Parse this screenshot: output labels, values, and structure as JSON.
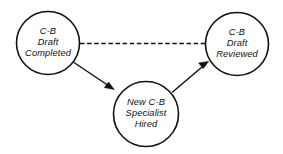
{
  "diagram": {
    "type": "node-link-diagram",
    "background_color": "#ffffff",
    "stroke_color": "#111111",
    "nodes": [
      {
        "id": "cb-draft-completed",
        "shape": "circle",
        "cx": 48,
        "cy": 43,
        "r": 31.5,
        "lines": [
          "C-B",
          "Draft",
          "Completed"
        ]
      },
      {
        "id": "new-cb-specialist-hired",
        "shape": "circle",
        "cx": 146,
        "cy": 114,
        "r": 32.5,
        "lines": [
          "New C-B",
          "Specialist",
          "Hired"
        ]
      },
      {
        "id": "cb-draft-reviewed",
        "shape": "circle",
        "cx": 237,
        "cy": 44,
        "r": 31.5,
        "lines": [
          "C-B",
          "Draft",
          "Reviewed"
        ]
      }
    ],
    "edges": [
      {
        "id": "edge-completed-to-reviewed",
        "from": "cb-draft-completed",
        "to": "cb-draft-reviewed",
        "style": "dashed",
        "arrow": "none"
      },
      {
        "id": "edge-completed-to-hired",
        "from": "cb-draft-completed",
        "to": "new-cb-specialist-hired",
        "style": "solid",
        "arrow": "end"
      },
      {
        "id": "edge-hired-to-reviewed",
        "from": "new-cb-specialist-hired",
        "to": "cb-draft-reviewed",
        "style": "solid",
        "arrow": "end"
      }
    ]
  }
}
